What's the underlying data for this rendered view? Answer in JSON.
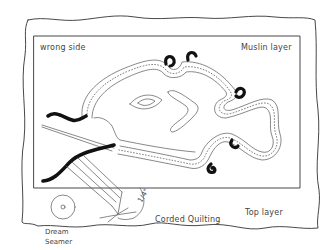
{
  "diagram": {
    "title": "Corded Quilting",
    "labels": {
      "wrong_side": "wrong side",
      "muslin_layer": "Muslin layer",
      "top_layer": "Top layer",
      "corded_quilting": "Corded Quilting",
      "tool_line1": "Dream",
      "tool_line2": "Seamer",
      "measurement": "1/4\""
    },
    "elements": [
      "outer fabric (top layer) with wavy edges",
      "inner rectangle (muslin layer)",
      "fish-shaped corded channel with dotted stitching",
      "eye and fin motif inside fish",
      "cord loops emerging at curves",
      "threading needle and cord",
      "Dream Seamer tool with wheel"
    ],
    "colors": {
      "ink": "#333333",
      "cord": "#111111",
      "background": "#ffffff"
    }
  }
}
